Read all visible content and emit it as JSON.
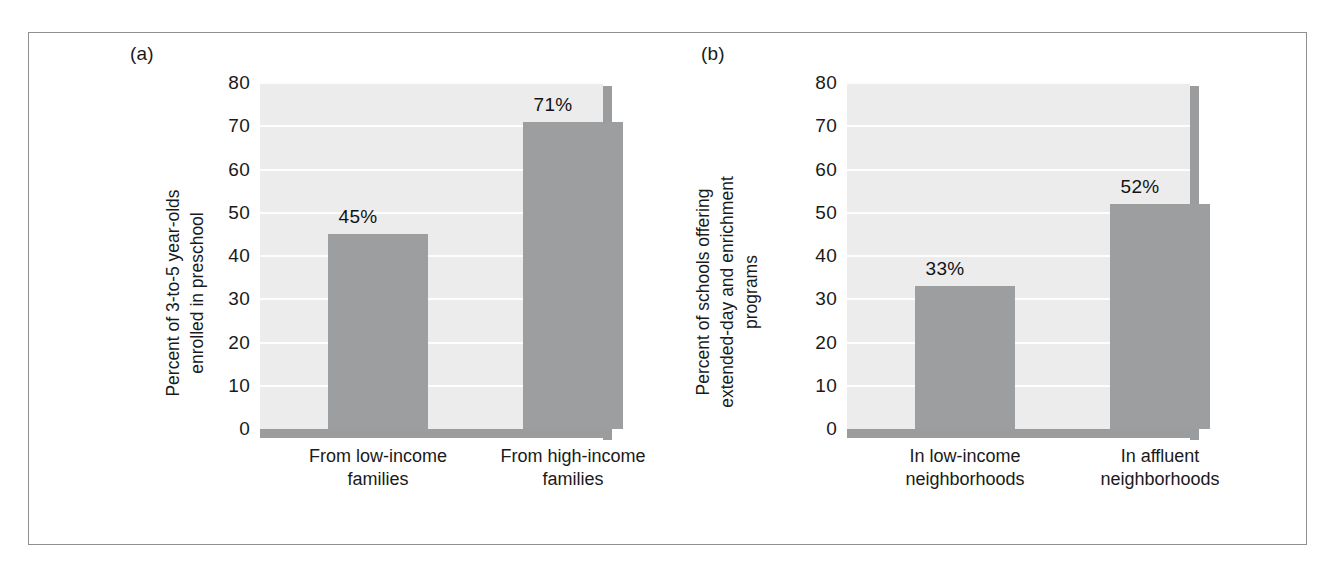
{
  "figure": {
    "panels": [
      {
        "tag": "(a)",
        "chart_data": {
          "type": "bar",
          "title": "",
          "xlabel": "",
          "ylabel": "Percent of 3-to-5 year-olds enrolled in preschool",
          "ylabel_lines": [
            "Percent of 3-to-5 year-olds",
            "enrolled in preschool"
          ],
          "categories": [
            "From low-income families",
            "From high-income families"
          ],
          "category_lines": [
            [
              "From low-income",
              "families"
            ],
            [
              "From high-income",
              "families"
            ]
          ],
          "values": [
            45,
            71
          ],
          "value_labels": [
            "45%",
            "71%"
          ],
          "ylim": [
            0,
            80
          ],
          "yticks": [
            80,
            70,
            60,
            50,
            40,
            30,
            20,
            10,
            0
          ],
          "grid": true,
          "legend": "none",
          "bar_color": "#9d9ea0",
          "plot_bg_color": "#ececed",
          "gridline_color": "#fdfdfd"
        }
      },
      {
        "tag": "(b)",
        "chart_data": {
          "type": "bar",
          "title": "",
          "xlabel": "",
          "ylabel": "Percent of schools offering extended-day and enrichment programs",
          "ylabel_lines": [
            "Percent of schools offering",
            "extended-day and enrichment",
            "programs"
          ],
          "categories": [
            "In low-income neighborhoods",
            "In affluent neighborhoods"
          ],
          "category_lines": [
            [
              "In low-income",
              "neighborhoods"
            ],
            [
              "In affluent",
              "neighborhoods"
            ]
          ],
          "values": [
            33,
            52
          ],
          "value_labels": [
            "33%",
            "52%"
          ],
          "ylim": [
            0,
            80
          ],
          "yticks": [
            80,
            70,
            60,
            50,
            40,
            30,
            20,
            10,
            0
          ],
          "grid": true,
          "legend": "none",
          "bar_color": "#9d9ea0",
          "plot_bg_color": "#ececed",
          "gridline_color": "#fdfdfd"
        }
      }
    ]
  },
  "chart_data": [
    {
      "type": "bar",
      "panel": "(a)",
      "title": "",
      "xlabel": "",
      "ylabel": "Percent of 3-to-5 year-olds enrolled in preschool",
      "categories": [
        "From low-income families",
        "From high-income families"
      ],
      "values": [
        45,
        71
      ],
      "value_labels": [
        "45%",
        "71%"
      ],
      "ylim": [
        0,
        80
      ],
      "yticks": [
        0,
        10,
        20,
        30,
        40,
        50,
        60,
        70,
        80
      ],
      "grid": true,
      "legend": "none"
    },
    {
      "type": "bar",
      "panel": "(b)",
      "title": "",
      "xlabel": "",
      "ylabel": "Percent of schools offering extended-day and enrichment programs",
      "categories": [
        "In low-income neighborhoods",
        "In affluent neighborhoods"
      ],
      "values": [
        33,
        52
      ],
      "value_labels": [
        "33%",
        "52%"
      ],
      "ylim": [
        0,
        80
      ],
      "yticks": [
        0,
        10,
        20,
        30,
        40,
        50,
        60,
        70,
        80
      ],
      "grid": true,
      "legend": "none"
    }
  ]
}
